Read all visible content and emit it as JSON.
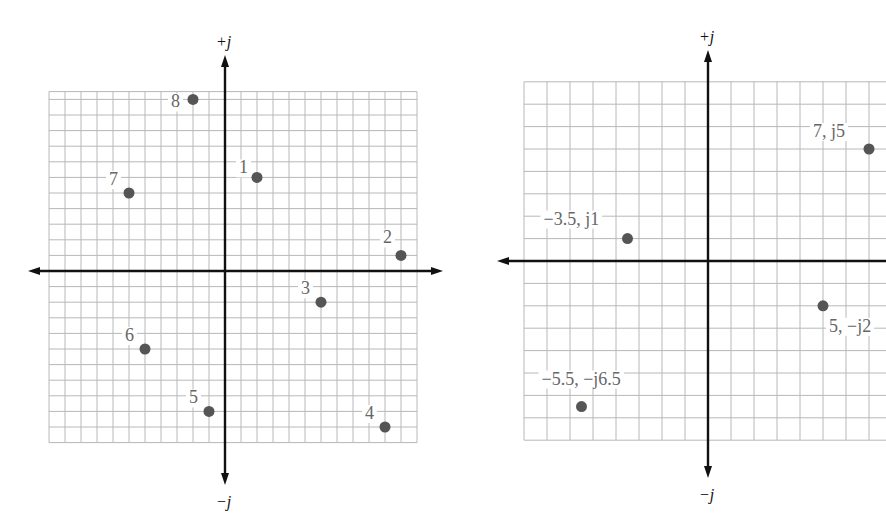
{
  "chart_data": [
    {
      "type": "scatter",
      "title": "",
      "xlabel": "",
      "ylabel": "",
      "axis_labels": {
        "top": "+j",
        "bottom": "−j"
      },
      "grid": true,
      "xlim": [
        -11,
        12
      ],
      "ylim": [
        -11,
        12
      ],
      "points": [
        {
          "label": "1",
          "x": 2,
          "y": 6
        },
        {
          "label": "2",
          "x": 11,
          "y": 1
        },
        {
          "label": "3",
          "x": 6,
          "y": -2
        },
        {
          "label": "4",
          "x": 10,
          "y": -10
        },
        {
          "label": "5",
          "x": -1,
          "y": -9
        },
        {
          "label": "6",
          "x": -5,
          "y": -5
        },
        {
          "label": "7",
          "x": -6,
          "y": 5
        },
        {
          "label": "8",
          "x": -2,
          "y": 11
        }
      ]
    },
    {
      "type": "scatter",
      "title": "",
      "xlabel": "",
      "ylabel": "",
      "axis_labels": {
        "top": "+j",
        "bottom": "−j"
      },
      "grid": true,
      "xlim": [
        -8,
        7.5
      ],
      "ylim": [
        -8,
        8
      ],
      "points": [
        {
          "label": "7, j5",
          "x": 7,
          "y": 5
        },
        {
          "label": "−3.5, j1",
          "x": -3.5,
          "y": 1
        },
        {
          "label": "5, −j2",
          "x": 5,
          "y": -2
        },
        {
          "label": "−5.5, −j6.5",
          "x": -5.5,
          "y": -6.5
        }
      ]
    }
  ]
}
